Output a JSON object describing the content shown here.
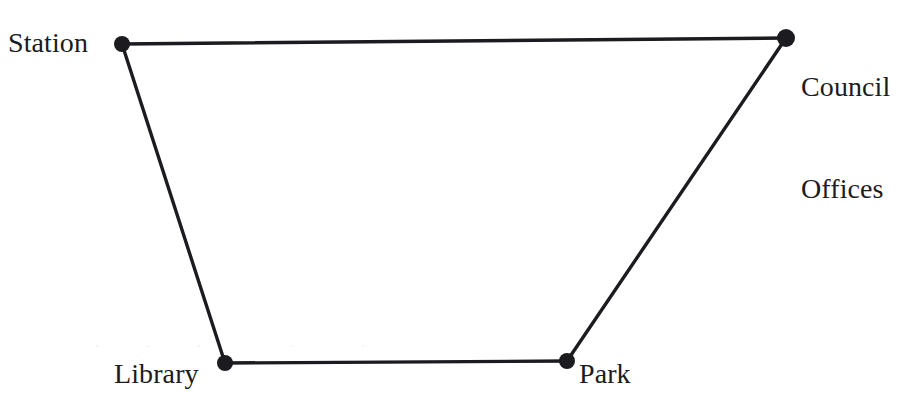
{
  "figure": {
    "background_color": "#ffffff",
    "stroke_color": "#1b1b20",
    "text_color": "#1b1b20",
    "width": 913,
    "height": 406
  },
  "nodes": [
    {
      "id": "station",
      "label": "Station",
      "x": 122,
      "y": 44,
      "radius": 8
    },
    {
      "id": "council",
      "label": "Council Offices",
      "label_line1": "Council",
      "label_line2": "Offices",
      "x": 786,
      "y": 38,
      "radius": 9
    },
    {
      "id": "library",
      "label": "Library",
      "x": 225,
      "y": 363,
      "radius": 8
    },
    {
      "id": "park",
      "label": "Park",
      "x": 567,
      "y": 361,
      "radius": 8
    }
  ],
  "edges": [
    {
      "id": "station-council",
      "from": "Station",
      "to": "Council Offices",
      "x1": 122,
      "y1": 44,
      "x2": 786,
      "y2": 38
    },
    {
      "id": "station-library",
      "from": "Station",
      "to": "Library",
      "x1": 122,
      "y1": 44,
      "x2": 225,
      "y2": 363
    },
    {
      "id": "library-park",
      "from": "Library",
      "to": "Park",
      "x1": 225,
      "y1": 363,
      "x2": 567,
      "y2": 361
    },
    {
      "id": "park-council",
      "from": "Park",
      "to": "Council Offices",
      "x1": 567,
      "y1": 361,
      "x2": 786,
      "y2": 38
    }
  ],
  "artifacts": {
    "bleed_text": "  .    .    .        .      ."
  }
}
